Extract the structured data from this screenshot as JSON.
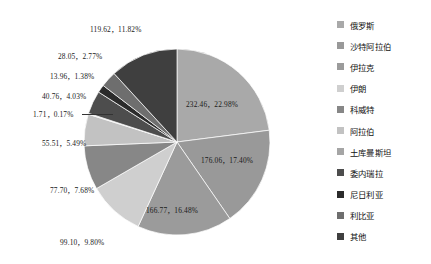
{
  "chart_data": {
    "type": "pie",
    "title": "",
    "legend_position": "right",
    "grid": false,
    "label_format": "value, percent",
    "categories": [
      "俄罗斯",
      "沙特阿拉伯",
      "伊拉克",
      "伊朗",
      "科威特",
      "阿拉伯",
      "土库曼斯坦",
      "委内瑞拉",
      "尼日利亚",
      "利比亚",
      "其他"
    ],
    "values": [
      232.46,
      176.06,
      166.77,
      99.1,
      77.7,
      55.51,
      1.71,
      40.76,
      13.96,
      28.05,
      119.62
    ],
    "percents": [
      22.98,
      17.4,
      16.48,
      9.8,
      7.68,
      5.49,
      0.17,
      4.03,
      1.38,
      2.77,
      11.82
    ],
    "colors": [
      "#a9a9a9",
      "#999999",
      "#9b9b9b",
      "#cfcfcf",
      "#878787",
      "#c2c2c2",
      "#d9d9d9",
      "#4d4d4d",
      "#2b2b2b",
      "#6e6e6e",
      "#3f3f3f"
    ],
    "slices": [
      {
        "label": "俄罗斯",
        "value": "232.46",
        "percent": "22.98%",
        "data_label": "232.46，22.98%",
        "color": "#a9a9a9"
      },
      {
        "label": "沙特阿拉伯",
        "value": "176.06",
        "percent": "17.40%",
        "data_label": "176.06，17.40%",
        "color": "#999999"
      },
      {
        "label": "伊拉克",
        "value": "166.77",
        "percent": "16.48%",
        "data_label": "166.77，16.48%",
        "color": "#9b9b9b"
      },
      {
        "label": "伊朗",
        "value": "99.10",
        "percent": "9.80%",
        "data_label": "99.10，9.80%",
        "color": "#cfcfcf"
      },
      {
        "label": "科威特",
        "value": "77.70",
        "percent": "7.68%",
        "data_label": "77.70，7.68%",
        "color": "#878787"
      },
      {
        "label": "阿拉伯",
        "value": "55.51",
        "percent": "5.49%",
        "data_label": "55.51，5.49%",
        "color": "#c2c2c2"
      },
      {
        "label": "土库曼斯坦",
        "value": "1.71",
        "percent": "0.17%",
        "data_label": "1.71，0.17%",
        "color": "#d9d9d9"
      },
      {
        "label": "委内瑞拉",
        "value": "40.76",
        "percent": "4.03%",
        "data_label": "40.76，4.03%",
        "color": "#4d4d4d"
      },
      {
        "label": "尼日利亚",
        "value": "13.96",
        "percent": "1.38%",
        "data_label": "13.96，1.38%",
        "color": "#2b2b2b"
      },
      {
        "label": "利比亚",
        "value": "28.05",
        "percent": "2.77%",
        "data_label": "28.05，2.77%",
        "color": "#6e6e6e"
      },
      {
        "label": "其他",
        "value": "119.62",
        "percent": "11.82%",
        "data_label": "119.62，11.82%",
        "color": "#3f3f3f"
      }
    ]
  },
  "labels": {
    "l0": "232.46，22.98%",
    "l1": "176.06，17.40%",
    "l2": "166.77，16.48%",
    "l3": "99.10，9.80%",
    "l4": "77.70，7.68%",
    "l5": "55.51，5.49%",
    "l6": "1.71，0.17%",
    "l7": "40.76，4.03%",
    "l8": "13.96，1.38%",
    "l9": "28.05，2.77%",
    "l10": "119.62，11.82%"
  },
  "legend": {
    "items": [
      {
        "label": "俄罗斯",
        "color": "#a9a9a9"
      },
      {
        "label": "沙特阿拉伯",
        "color": "#999999"
      },
      {
        "label": "伊拉克",
        "color": "#9b9b9b"
      },
      {
        "label": "伊朗",
        "color": "#cfcfcf"
      },
      {
        "label": "科威特",
        "color": "#878787"
      },
      {
        "label": "阿拉伯",
        "color": "#c2c2c2"
      },
      {
        "label": "土库曼斯坦",
        "color": "#a5a5a5"
      },
      {
        "label": "委内瑞拉",
        "color": "#4d4d4d"
      },
      {
        "label": "尼日利亚",
        "color": "#2b2b2b"
      },
      {
        "label": "利比亚",
        "color": "#6e6e6e"
      },
      {
        "label": "其他",
        "color": "#3f3f3f"
      }
    ]
  }
}
